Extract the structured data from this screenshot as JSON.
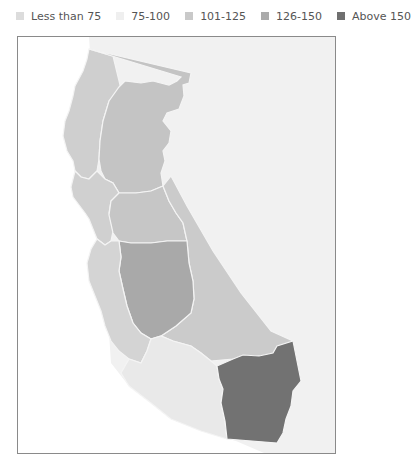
{
  "legend": {
    "items": [
      {
        "label": "Less than 75",
        "color": "#dcdcdc"
      },
      {
        "label": "75-100",
        "color": "#efefef"
      },
      {
        "label": "101-125",
        "color": "#c9c9c9"
      },
      {
        "label": "126-150",
        "color": "#ababab"
      },
      {
        "label": "Above 150",
        "color": "#6f6f6f"
      }
    ]
  },
  "map": {
    "region": "California",
    "outside_land_color": "#f1f1f1",
    "water_color": "#ffffff",
    "border_color": "#8a8a8a",
    "regions": [
      {
        "name": "North Coast",
        "bin": "Less than 75",
        "color": "#cfcfcf"
      },
      {
        "name": "Northern Sacramento Valley / Northeast",
        "bin": "101-125",
        "color": "#c4c4c4"
      },
      {
        "name": "Bay Area",
        "bin": "Less than 75",
        "color": "#d0d0d0"
      },
      {
        "name": "Sierra / Gold Country",
        "bin": "101-125",
        "color": "#c6c6c6"
      },
      {
        "name": "Central Coast",
        "bin": "Less than 75",
        "color": "#d4d4d4"
      },
      {
        "name": "San Joaquin Valley",
        "bin": "126-150",
        "color": "#a9a9a9"
      },
      {
        "name": "Eastern Sierra / Kern",
        "bin": "101-125",
        "color": "#cbcbcb"
      },
      {
        "name": "Southern Coast (LA / San Diego)",
        "bin": "75-100",
        "color": "#e9e9e9"
      },
      {
        "name": "Inland Empire (Riverside / San Bernardino)",
        "bin": "Above 150",
        "color": "#727272"
      }
    ]
  }
}
